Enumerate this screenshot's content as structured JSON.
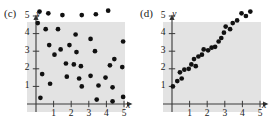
{
  "figure": {
    "panels": [
      {
        "id": "c",
        "label": "(c)",
        "x_axis_label": "x",
        "y_axis_label": "y",
        "x_ticks": [
          "1",
          "2",
          "3",
          "4",
          "5"
        ],
        "y_ticks": [
          "1",
          "2",
          "3",
          "4",
          "5"
        ]
      },
      {
        "id": "d",
        "label": "(d)",
        "x_axis_label": "x",
        "y_axis_label": "y",
        "x_ticks": [
          "1",
          "2",
          "3",
          "4",
          "5"
        ],
        "y_ticks": [
          "1",
          "2",
          "3",
          "4",
          "5"
        ]
      }
    ]
  },
  "chart_data": [
    {
      "type": "scatter",
      "title": "(c)",
      "xlabel": "x",
      "ylabel": "y",
      "xlim": [
        0,
        5.6
      ],
      "ylim": [
        0,
        5.6
      ],
      "xticks": [
        1,
        2,
        3,
        4,
        5
      ],
      "yticks": [
        1,
        2,
        3,
        4,
        5
      ],
      "grid": false,
      "legend": false,
      "annotation": "no correlation / random scatter",
      "marker_color": "#111111",
      "points": [
        {
          "x": 0.2,
          "y": 5.25
        },
        {
          "x": 0.1,
          "y": 4.6
        },
        {
          "x": 0.7,
          "y": 5.15
        },
        {
          "x": 1.5,
          "y": 5.05
        },
        {
          "x": 2.6,
          "y": 5.05
        },
        {
          "x": 3.4,
          "y": 5.1
        },
        {
          "x": 4.1,
          "y": 5.3
        },
        {
          "x": 0.55,
          "y": 4.25
        },
        {
          "x": 1.25,
          "y": 4.25
        },
        {
          "x": 2.25,
          "y": 3.95
        },
        {
          "x": 0.75,
          "y": 3.35
        },
        {
          "x": 1.4,
          "y": 3.1
        },
        {
          "x": 1.9,
          "y": 3.35
        },
        {
          "x": 3.1,
          "y": 3.7
        },
        {
          "x": 4.95,
          "y": 3.55
        },
        {
          "x": 1.05,
          "y": 2.8
        },
        {
          "x": 2.3,
          "y": 2.95
        },
        {
          "x": 3.35,
          "y": 3.0
        },
        {
          "x": 4.45,
          "y": 2.55
        },
        {
          "x": 1.7,
          "y": 2.3
        },
        {
          "x": 2.15,
          "y": 2.25
        },
        {
          "x": 2.55,
          "y": 2.15
        },
        {
          "x": 4.2,
          "y": 2.2
        },
        {
          "x": 4.9,
          "y": 2.1
        },
        {
          "x": 0.35,
          "y": 1.7
        },
        {
          "x": 1.75,
          "y": 1.55
        },
        {
          "x": 2.45,
          "y": 1.45
        },
        {
          "x": 3.1,
          "y": 1.6
        },
        {
          "x": 3.95,
          "y": 1.5
        },
        {
          "x": 0.8,
          "y": 1.15
        },
        {
          "x": 2.6,
          "y": 1.0
        },
        {
          "x": 3.55,
          "y": 1.05
        },
        {
          "x": 4.35,
          "y": 0.95
        },
        {
          "x": 0.25,
          "y": 0.35
        },
        {
          "x": 3.45,
          "y": 0.25
        },
        {
          "x": 4.35,
          "y": 0.15
        },
        {
          "x": 4.95,
          "y": 0.4
        }
      ]
    },
    {
      "type": "scatter",
      "title": "(d)",
      "xlabel": "x",
      "ylabel": "y",
      "xlim": [
        0,
        5.6
      ],
      "ylim": [
        0,
        5.6
      ],
      "xticks": [
        1,
        2,
        3,
        4,
        5
      ],
      "yticks": [
        1,
        2,
        3,
        4,
        5
      ],
      "grid": false,
      "legend": false,
      "annotation": "strong positive linear correlation",
      "marker_color": "#111111",
      "points": [
        {
          "x": 0.05,
          "y": 1.0
        },
        {
          "x": 0.3,
          "y": 1.3
        },
        {
          "x": 0.55,
          "y": 1.45
        },
        {
          "x": 0.45,
          "y": 1.8
        },
        {
          "x": 0.7,
          "y": 1.95
        },
        {
          "x": 0.95,
          "y": 2.0
        },
        {
          "x": 1.1,
          "y": 2.25
        },
        {
          "x": 1.35,
          "y": 2.15
        },
        {
          "x": 1.25,
          "y": 2.55
        },
        {
          "x": 1.5,
          "y": 2.7
        },
        {
          "x": 1.7,
          "y": 2.8
        },
        {
          "x": 1.8,
          "y": 3.1
        },
        {
          "x": 2.05,
          "y": 3.05
        },
        {
          "x": 2.25,
          "y": 3.2
        },
        {
          "x": 2.45,
          "y": 3.25
        },
        {
          "x": 2.65,
          "y": 3.55
        },
        {
          "x": 2.8,
          "y": 3.75
        },
        {
          "x": 2.95,
          "y": 4.05
        },
        {
          "x": 3.05,
          "y": 4.4
        },
        {
          "x": 3.3,
          "y": 4.25
        },
        {
          "x": 3.45,
          "y": 4.6
        },
        {
          "x": 3.7,
          "y": 4.75
        },
        {
          "x": 3.95,
          "y": 5.15
        },
        {
          "x": 4.2,
          "y": 5.0
        },
        {
          "x": 4.45,
          "y": 5.25
        }
      ]
    }
  ]
}
